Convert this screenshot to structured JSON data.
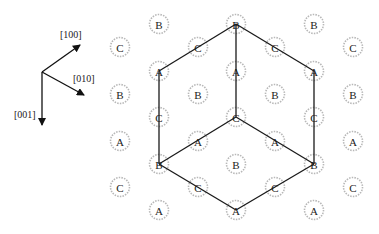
{
  "axes": {
    "origin": [
      42,
      72
    ],
    "items": [
      {
        "label": "[100]",
        "end": [
          80,
          45
        ],
        "label_pos": [
          60,
          38
        ]
      },
      {
        "label": "[010]",
        "end": [
          84,
          95
        ],
        "label_pos": [
          73,
          82
        ]
      },
      {
        "label": "[001]",
        "end": [
          42,
          125
        ],
        "label_pos": [
          14,
          118
        ]
      }
    ]
  },
  "nodes": [
    {
      "label": "C",
      "x": 120,
      "y": 47
    },
    {
      "label": "B",
      "x": 120,
      "y": 94
    },
    {
      "label": "A",
      "x": 120,
      "y": 141
    },
    {
      "label": "C",
      "x": 120,
      "y": 187
    },
    {
      "label": "B",
      "x": 159,
      "y": 24
    },
    {
      "label": "A",
      "x": 159,
      "y": 71
    },
    {
      "label": "C",
      "x": 159,
      "y": 117
    },
    {
      "label": "B",
      "x": 159,
      "y": 164
    },
    {
      "label": "A",
      "x": 159,
      "y": 210
    },
    {
      "label": "C",
      "x": 198,
      "y": 47
    },
    {
      "label": "B",
      "x": 198,
      "y": 94
    },
    {
      "label": "A",
      "x": 198,
      "y": 141
    },
    {
      "label": "C",
      "x": 198,
      "y": 187
    },
    {
      "label": "B",
      "x": 236,
      "y": 24
    },
    {
      "label": "A",
      "x": 236,
      "y": 71
    },
    {
      "label": "C",
      "x": 236,
      "y": 117
    },
    {
      "label": "B",
      "x": 236,
      "y": 164
    },
    {
      "label": "A",
      "x": 236,
      "y": 210
    },
    {
      "label": "C",
      "x": 275,
      "y": 47
    },
    {
      "label": "B",
      "x": 275,
      "y": 94
    },
    {
      "label": "A",
      "x": 275,
      "y": 141
    },
    {
      "label": "C",
      "x": 275,
      "y": 187
    },
    {
      "label": "B",
      "x": 314,
      "y": 24
    },
    {
      "label": "A",
      "x": 314,
      "y": 71
    },
    {
      "label": "C",
      "x": 314,
      "y": 117
    },
    {
      "label": "B",
      "x": 314,
      "y": 164
    },
    {
      "label": "A",
      "x": 314,
      "y": 210
    },
    {
      "label": "C",
      "x": 353,
      "y": 47
    },
    {
      "label": "B",
      "x": 353,
      "y": 94
    },
    {
      "label": "A",
      "x": 353,
      "y": 141
    },
    {
      "label": "C",
      "x": 353,
      "y": 187
    }
  ],
  "edges": [
    [
      [
        236,
        24
      ],
      [
        159,
        71
      ]
    ],
    [
      [
        236,
        24
      ],
      [
        314,
        71
      ]
    ],
    [
      [
        236,
        24
      ],
      [
        236,
        117
      ]
    ],
    [
      [
        159,
        71
      ],
      [
        159,
        164
      ]
    ],
    [
      [
        314,
        71
      ],
      [
        314,
        164
      ]
    ],
    [
      [
        236,
        117
      ],
      [
        159,
        164
      ]
    ],
    [
      [
        236,
        117
      ],
      [
        314,
        164
      ]
    ],
    [
      [
        159,
        164
      ],
      [
        236,
        210
      ]
    ],
    [
      [
        314,
        164
      ],
      [
        236,
        210
      ]
    ]
  ]
}
